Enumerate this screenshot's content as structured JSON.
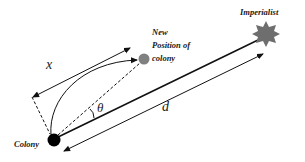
{
  "diagram": {
    "labels": {
      "colony": "Colony",
      "new_position_line1": "New",
      "new_position_line2": "Position of",
      "new_position_line3": "colony",
      "imperialist": "Imperialist"
    },
    "variables": {
      "x": "x",
      "theta": "θ",
      "d": "d"
    },
    "colors": {
      "colony": "#000000",
      "new_position": "#808080",
      "imperialist": "#6e6e6e",
      "lines": "#111111"
    }
  }
}
